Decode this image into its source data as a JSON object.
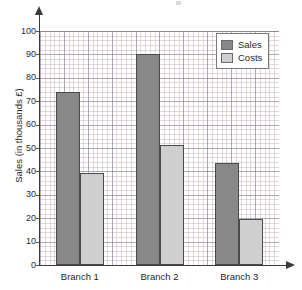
{
  "chart_data": {
    "type": "bar",
    "title": "",
    "xlabel": "",
    "ylabel": "Sales (in thousands £)",
    "categories": [
      "Branch 1",
      "Branch 2",
      "Branch 3"
    ],
    "series": [
      {
        "name": "Sales",
        "color": "#888888",
        "values": [
          74,
          90,
          43.5
        ]
      },
      {
        "name": "Costs",
        "color": "#cfcfcf",
        "values": [
          39.5,
          51.5,
          19.5
        ]
      }
    ],
    "ylim": [
      0,
      100
    ],
    "ytick_labels": [
      "0",
      "10",
      "20",
      "30",
      "40",
      "50",
      "60",
      "70",
      "80",
      "90",
      "100"
    ],
    "ytick_values": [
      0,
      10,
      20,
      30,
      40,
      50,
      60,
      70,
      80,
      90,
      100
    ],
    "grid": true,
    "grid_minor": true,
    "legend_position": "top-right",
    "legend": [
      "Sales",
      "Costs"
    ]
  },
  "legend": {
    "entries": [
      {
        "label": "Sales",
        "swatch": "legend-swatch-sales"
      },
      {
        "label": "Costs",
        "swatch": "legend-swatch-costs"
      }
    ]
  },
  "axes": {
    "y_title": "Sales (in thousands £)"
  },
  "colors": {
    "sales": "#888888",
    "costs": "#cfcfcf",
    "axis": "#3a3a3a",
    "grid_major": "#8a8a9a",
    "grid_minor": "#bdaab4"
  }
}
